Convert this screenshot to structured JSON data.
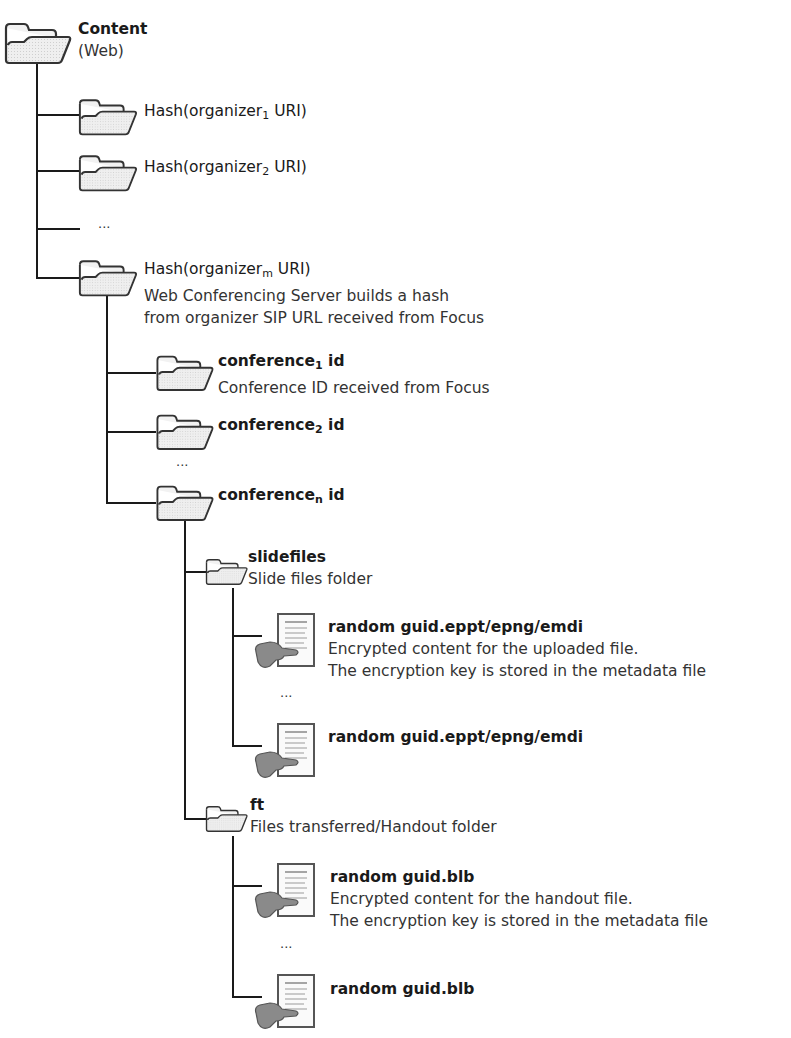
{
  "diagram": {
    "type": "folder-tree",
    "root": {
      "title": "Content",
      "desc": "(Web)"
    },
    "organizers": [
      {
        "pre": "Hash(organizer",
        "sub": "1",
        "post": " URI)"
      },
      {
        "pre": "Hash(organizer",
        "sub": "2",
        "post": " URI)"
      },
      {
        "ellipsis": "..."
      },
      {
        "pre": "Hash(organizer",
        "sub": "m",
        "post": " URI)",
        "desc1": "Web Conferencing Server builds a hash",
        "desc2": "from organizer SIP URL received from Focus"
      }
    ],
    "conferences": [
      {
        "pre": "conference",
        "sub": "1",
        "post": " id",
        "desc": "Conference ID received from Focus"
      },
      {
        "pre": "conference",
        "sub": "2",
        "post": " id"
      },
      {
        "ellipsis": "..."
      },
      {
        "pre": "conference",
        "sub": "n",
        "post": " id"
      }
    ],
    "slidefiles": {
      "title": "slidefiles",
      "desc": "Slide files folder",
      "files": [
        {
          "title": "random guid.eppt/epng/emdi",
          "desc1": "Encrypted content for the uploaded file.",
          "desc2": "The encryption key is stored in the metadata file"
        },
        {
          "ellipsis": "..."
        },
        {
          "title": "random guid.eppt/epng/emdi"
        }
      ]
    },
    "ft": {
      "title": "ft",
      "desc": "Files transferred/Handout folder",
      "files": [
        {
          "title": "random guid.blb",
          "desc1": "Encrypted content for the handout file.",
          "desc2": "The encryption key is stored in the metadata file"
        },
        {
          "ellipsis": "..."
        },
        {
          "title": "random guid.blb"
        }
      ]
    }
  },
  "colors": {
    "line": "#1a1a1a",
    "folder_fill": "#ececec",
    "folder_stroke": "#333333",
    "hand_fill": "#8a8a8a"
  }
}
